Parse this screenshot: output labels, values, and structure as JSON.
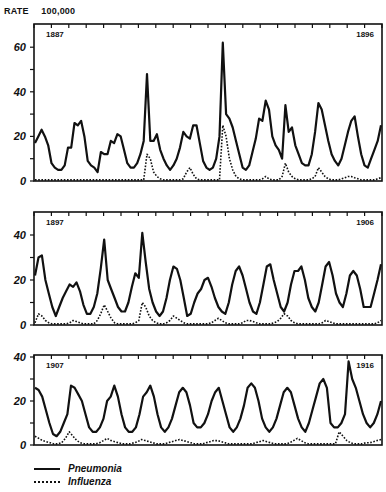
{
  "chart_data": [
    {
      "type": "line",
      "title": "",
      "ylabel": "RATE 100,000",
      "xlabel": "",
      "panel_start_label": "1887",
      "panel_end_label": "1896",
      "ylim": [
        0,
        68
      ],
      "yticks": [
        0,
        20,
        40,
        60
      ],
      "grid": false,
      "x_range_years": [
        1887,
        1896
      ],
      "series": [
        {
          "name": "Pneumonia",
          "style": "solid",
          "values": [
            17,
            20,
            23,
            20,
            16,
            8,
            6,
            5,
            5,
            7,
            15,
            15,
            26,
            25,
            27,
            20,
            9,
            7,
            6,
            4,
            13,
            12,
            12,
            18,
            17,
            21,
            20,
            14,
            8,
            6,
            6,
            8,
            12,
            18,
            48,
            18,
            18,
            21,
            14,
            10,
            7,
            5,
            7,
            10,
            15,
            22,
            20,
            19,
            25,
            25,
            17,
            9,
            6,
            5,
            6,
            10,
            20,
            62,
            30,
            28,
            24,
            18,
            12,
            6,
            5,
            7,
            13,
            19,
            28,
            27,
            36,
            32,
            20,
            16,
            14,
            10,
            34,
            22,
            24,
            16,
            12,
            8,
            7,
            7,
            12,
            22,
            35,
            32,
            25,
            18,
            12,
            9,
            7,
            10,
            16,
            22,
            27,
            29,
            20,
            12,
            7,
            6,
            10,
            14,
            18,
            25
          ]
        },
        {
          "name": "Influenza",
          "style": "dotted",
          "values": [
            0.5,
            0.5,
            0.5,
            0.5,
            0.5,
            0.5,
            0.5,
            0.5,
            0.5,
            0.5,
            0.5,
            0.5,
            0.5,
            0.5,
            0.5,
            0.5,
            0.5,
            0.5,
            0.5,
            0.5,
            0.5,
            0.5,
            0.5,
            0.5,
            0.5,
            0.5,
            0.5,
            0.5,
            0.5,
            0.5,
            0.5,
            0.5,
            0.5,
            0.5,
            12,
            10,
            4,
            2,
            1,
            0.5,
            0.5,
            0.5,
            0.5,
            0.5,
            0.5,
            1,
            4,
            6,
            3,
            1,
            0.5,
            0.5,
            0.5,
            0.5,
            0.5,
            0.5,
            0.5,
            25,
            20,
            10,
            5,
            2,
            1,
            0.5,
            0.5,
            0.5,
            0.5,
            0.5,
            0.5,
            1,
            2,
            1,
            0.5,
            0.5,
            0.5,
            2,
            8,
            4,
            2,
            1,
            0.5,
            0.5,
            0.5,
            0.5,
            1,
            2,
            6,
            4,
            2,
            1,
            0.5,
            0.5,
            0.5,
            1,
            1.5,
            2,
            2,
            1.5,
            1,
            0.5,
            0.5,
            0.5,
            0.5,
            0.5,
            1,
            1.5
          ]
        }
      ]
    },
    {
      "type": "line",
      "title": "",
      "ylabel": "RATE 100,000",
      "xlabel": "",
      "panel_start_label": "1897",
      "panel_end_label": "1906",
      "ylim": [
        0,
        48
      ],
      "yticks": [
        0,
        20,
        40
      ],
      "grid": false,
      "x_range_years": [
        1897,
        1906
      ],
      "series": [
        {
          "name": "Pneumonia",
          "style": "solid",
          "values": [
            22,
            30,
            31,
            20,
            14,
            8,
            4,
            8,
            12,
            15,
            18,
            17,
            19,
            15,
            9,
            5,
            5,
            8,
            14,
            25,
            38,
            20,
            16,
            12,
            8,
            6,
            6,
            10,
            17,
            23,
            21,
            41,
            28,
            16,
            10,
            6,
            4,
            6,
            12,
            20,
            26,
            25,
            20,
            12,
            4,
            5,
            10,
            14,
            16,
            20,
            21,
            17,
            12,
            8,
            6,
            5,
            10,
            18,
            24,
            26,
            22,
            16,
            10,
            6,
            5,
            10,
            18,
            26,
            27,
            20,
            14,
            8,
            6,
            10,
            18,
            24,
            24,
            26,
            20,
            12,
            8,
            6,
            10,
            18,
            26,
            28,
            22,
            14,
            10,
            8,
            14,
            22,
            24,
            22,
            16,
            8,
            8,
            8,
            14,
            20,
            27
          ]
        },
        {
          "name": "Influenza",
          "style": "dotted",
          "values": [
            1,
            5,
            4,
            2,
            1,
            0.5,
            0.5,
            0.5,
            0.5,
            0.5,
            1,
            2,
            1.5,
            1,
            0.5,
            0.5,
            0.5,
            0.5,
            2,
            5,
            9,
            6,
            3,
            1,
            0.5,
            0.5,
            0.5,
            0.5,
            0.5,
            1,
            2,
            10,
            8,
            4,
            2,
            1,
            0.5,
            0.5,
            1,
            2,
            4,
            3,
            2,
            1,
            0.5,
            0.5,
            0.5,
            0.5,
            0.5,
            0.5,
            0.5,
            1,
            2,
            3,
            2,
            1,
            0.5,
            0.5,
            0.5,
            0.5,
            1,
            2,
            2,
            1.5,
            1,
            0.5,
            0.5,
            0.5,
            0.5,
            1,
            1.5,
            3,
            5,
            4,
            2,
            1,
            0.5,
            0.5,
            0.5,
            0.5,
            0.5,
            0.5,
            0.5,
            1,
            2,
            1.5,
            1,
            0.5,
            0.5,
            0.5,
            0.5,
            0.5,
            0.5,
            0.5,
            0.5,
            0.5,
            0.5,
            0.5,
            0.5,
            1,
            2
          ]
        }
      ]
    },
    {
      "type": "line",
      "title": "",
      "ylabel": "RATE 100,000",
      "xlabel": "",
      "panel_start_label": "1907",
      "panel_end_label": "1916",
      "ylim": [
        0,
        40
      ],
      "yticks": [
        0,
        20,
        40
      ],
      "grid": false,
      "x_range_years": [
        1907,
        1916
      ],
      "series": [
        {
          "name": "Pneumonia",
          "style": "solid",
          "values": [
            26,
            25,
            22,
            16,
            10,
            5,
            4,
            6,
            10,
            14,
            27,
            26,
            23,
            20,
            14,
            8,
            6,
            6,
            8,
            12,
            20,
            22,
            27,
            22,
            14,
            8,
            6,
            6,
            8,
            14,
            22,
            24,
            27,
            22,
            14,
            8,
            6,
            8,
            12,
            18,
            24,
            26,
            24,
            18,
            10,
            8,
            8,
            10,
            14,
            20,
            24,
            26,
            20,
            14,
            8,
            6,
            8,
            12,
            18,
            26,
            28,
            26,
            20,
            12,
            8,
            6,
            8,
            12,
            18,
            24,
            26,
            24,
            18,
            12,
            8,
            6,
            10,
            16,
            22,
            28,
            30,
            26,
            10,
            8,
            8,
            10,
            14,
            38,
            30,
            26,
            20,
            14,
            10,
            8,
            10,
            14,
            20
          ]
        },
        {
          "name": "Influenza",
          "style": "dotted",
          "values": [
            4,
            3,
            2,
            1.5,
            1,
            0.5,
            0.5,
            1,
            3,
            6,
            4,
            2,
            1,
            0.5,
            0.5,
            0.5,
            0.5,
            1,
            2,
            3,
            2,
            1.5,
            1,
            0.5,
            0.5,
            0.5,
            1,
            1.5,
            2.5,
            2,
            1.5,
            1,
            0.5,
            0.5,
            0.5,
            1,
            1.5,
            2,
            2.5,
            2,
            1.5,
            1,
            0.5,
            0.5,
            0.5,
            1,
            1.5,
            2,
            2,
            1.5,
            1,
            0.5,
            0.5,
            0.5,
            0.5,
            0.5,
            0.5,
            0.5,
            1,
            1.5,
            2,
            1.5,
            1,
            0.5,
            0.5,
            0.5,
            0.5,
            1,
            2,
            3,
            2,
            1,
            0.5,
            0.5,
            0.5,
            0.5,
            0.5,
            0.5,
            0.5,
            0.5,
            6,
            4,
            2,
            1,
            0.5,
            0.5,
            0.5,
            1,
            1,
            1.5,
            2,
            2.5
          ]
        }
      ]
    }
  ],
  "header": {
    "rate_label": "RATE",
    "per_label": "100,000"
  },
  "legend": {
    "items": [
      {
        "label": "Pneumonia",
        "style": "solid"
      },
      {
        "label": "Influenza",
        "style": "dotted"
      }
    ]
  },
  "panels_layout": [
    {
      "x0": 34,
      "x1": 382,
      "y_top": 24,
      "y_zero": 181,
      "px_per_unit": 2.23
    },
    {
      "x0": 34,
      "x1": 382,
      "y_top": 212,
      "y_zero": 325,
      "px_per_unit": 2.25
    },
    {
      "x0": 34,
      "x1": 382,
      "y_top": 355,
      "y_zero": 445,
      "px_per_unit": 2.2
    }
  ],
  "colors": {
    "ink": "#111111",
    "background": "#ffffff"
  }
}
